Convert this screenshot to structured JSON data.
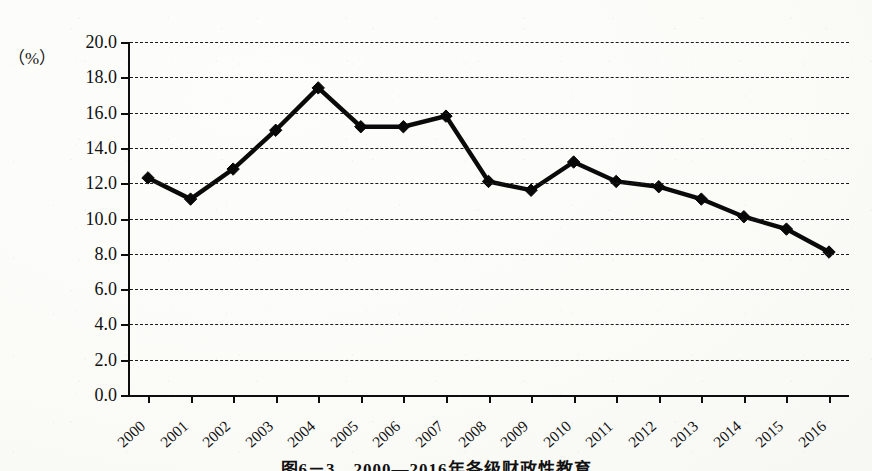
{
  "axis_unit_label": "（%）",
  "caption": "图6－3　2000—2016年各级财政性教育",
  "colors": {
    "ink": "#0a0a0a",
    "gridline": "#1b1b1b",
    "paper": "#fbfbf8"
  },
  "chart_data": {
    "type": "line",
    "title": "",
    "subtitle": "",
    "xlabel": "",
    "ylabel": "（%）",
    "ylim": [
      0.0,
      20.0
    ],
    "ytick_step": 2.0,
    "ytick_labels": [
      "0.0",
      "2.0",
      "4.0",
      "6.0",
      "8.0",
      "10.0",
      "12.0",
      "14.0",
      "16.0",
      "18.0",
      "20.0"
    ],
    "grid": "horizontal-dashed",
    "legend": "none",
    "marker": "diamond",
    "categories": [
      "2000",
      "2001",
      "2002",
      "2003",
      "2004",
      "2005",
      "2006",
      "2007",
      "2008",
      "2009",
      "2010",
      "2011",
      "2012",
      "2013",
      "2014",
      "2015",
      "2016"
    ],
    "values": [
      12.3,
      11.1,
      12.8,
      15.0,
      17.4,
      15.2,
      15.2,
      15.8,
      12.1,
      11.6,
      13.2,
      12.1,
      11.8,
      11.1,
      10.1,
      9.4,
      8.1
    ],
    "series": [
      {
        "name": "",
        "values": [
          12.3,
          11.1,
          12.8,
          15.0,
          17.4,
          15.2,
          15.2,
          15.8,
          12.1,
          11.6,
          13.2,
          12.1,
          11.8,
          11.1,
          10.1,
          9.4,
          8.1
        ]
      }
    ]
  }
}
